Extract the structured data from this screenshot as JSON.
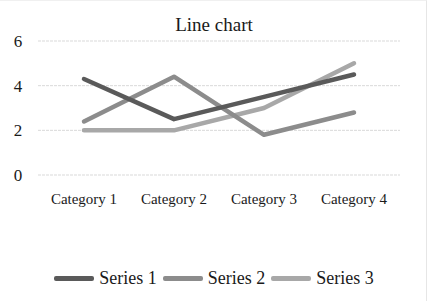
{
  "chart_data": {
    "type": "line",
    "title": "Line chart",
    "categories": [
      "Category 1",
      "Category 2",
      "Category 3",
      "Category 4"
    ],
    "series": [
      {
        "name": "Series 1",
        "values": [
          4.3,
          2.5,
          3.5,
          4.5
        ],
        "color": "#5a5a5a"
      },
      {
        "name": "Series 2",
        "values": [
          2.4,
          4.4,
          1.8,
          2.8
        ],
        "color": "#8c8c8c"
      },
      {
        "name": "Series 3",
        "values": [
          2,
          2,
          3,
          5
        ],
        "color": "#a8a8a8"
      }
    ],
    "yticks": [
      0,
      2,
      4,
      6
    ],
    "ylim": [
      0,
      6
    ],
    "xlabel": "",
    "ylabel": "",
    "grid": true,
    "legend_position": "bottom"
  }
}
